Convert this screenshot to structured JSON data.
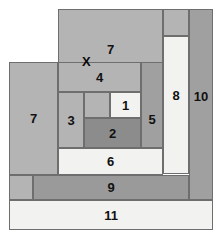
{
  "diagram": {
    "canvas": {
      "width": 224,
      "height": 238,
      "background": "#ffffff"
    },
    "palette": {
      "light": "#f2f2f0",
      "light_gray": "#d6d6d6",
      "mid_gray": "#b4b4b4",
      "gray": "#a8a8a8",
      "dark_gray": "#8e8e8e",
      "darker_gray": "#858585",
      "outline": "#6e6e6e"
    },
    "marker": {
      "label": "X",
      "x": 82,
      "y": 55
    },
    "blocks": [
      {
        "id": "block-7-top",
        "label": "7",
        "x": 58,
        "y": 9,
        "w": 105,
        "h": 54,
        "fill": "#b4b4b4",
        "label_x": 0,
        "label_y": 13
      },
      {
        "id": "block-corner-top-right",
        "label": "",
        "x": 163,
        "y": 9,
        "w": 26,
        "h": 27,
        "fill": "#b4b4b4",
        "label_x": 0,
        "label_y": 0
      },
      {
        "id": "block-10",
        "label": "10",
        "x": 189,
        "y": 9,
        "w": 24,
        "h": 191,
        "fill": "#a0a0a0",
        "label_x": 0,
        "label_y": -8
      },
      {
        "id": "block-8",
        "label": "8",
        "x": 163,
        "y": 36,
        "w": 26,
        "h": 138,
        "fill": "#f2f2f0",
        "label_x": 0,
        "label_y": -10
      },
      {
        "id": "block-7-left",
        "label": "7",
        "x": 9,
        "y": 62,
        "w": 49,
        "h": 113,
        "fill": "#b4b4b4",
        "label_x": 0,
        "label_y": 0
      },
      {
        "id": "block-4",
        "label": "4",
        "x": 58,
        "y": 62,
        "w": 83,
        "h": 30,
        "fill": "#b4b4b4",
        "label_x": 0,
        "label_y": 0
      },
      {
        "id": "block-5",
        "label": "5",
        "x": 141,
        "y": 62,
        "w": 22,
        "h": 86,
        "fill": "#a0a0a0",
        "label_x": 0,
        "label_y": 14
      },
      {
        "id": "block-3",
        "label": "3",
        "x": 58,
        "y": 92,
        "w": 26,
        "h": 56,
        "fill": "#b4b4b4",
        "label_x": 0,
        "label_y": 0
      },
      {
        "id": "block-unlabeled-mid",
        "label": "",
        "x": 84,
        "y": 92,
        "w": 26,
        "h": 26,
        "fill": "#b4b4b4",
        "label_x": 0,
        "label_y": 0
      },
      {
        "id": "block-1",
        "label": "1",
        "x": 110,
        "y": 92,
        "w": 31,
        "h": 26,
        "fill": "#f2f2f0",
        "label_x": 0,
        "label_y": 0
      },
      {
        "id": "block-2",
        "label": "2",
        "x": 84,
        "y": 118,
        "w": 57,
        "h": 30,
        "fill": "#8c8c8c",
        "label_x": 0,
        "label_y": 0
      },
      {
        "id": "block-6",
        "label": "6",
        "x": 58,
        "y": 148,
        "w": 105,
        "h": 27,
        "fill": "#f2f2f0",
        "label_x": 0,
        "label_y": 0
      },
      {
        "id": "block-corner-left-low",
        "label": "",
        "x": 9,
        "y": 175,
        "w": 24,
        "h": 25,
        "fill": "#b4b4b4",
        "label_x": 0,
        "label_y": 0
      },
      {
        "id": "block-9",
        "label": "9",
        "x": 33,
        "y": 175,
        "w": 156,
        "h": 25,
        "fill": "#9a9a9a",
        "label_x": 0,
        "label_y": 0
      },
      {
        "id": "block-11",
        "label": "11",
        "x": 9,
        "y": 200,
        "w": 204,
        "h": 30,
        "fill": "#f2f2f0",
        "label_x": 0,
        "label_y": 0
      }
    ]
  }
}
